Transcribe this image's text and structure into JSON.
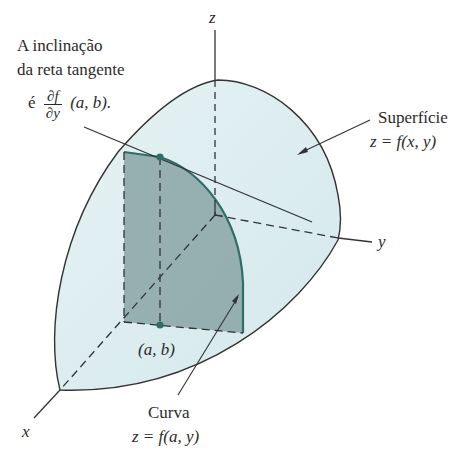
{
  "diagram": {
    "title_annotation": {
      "line1": "A inclinação",
      "line2": "da reta tangente",
      "prefix": "é",
      "frac_num": "∂f",
      "frac_den": "∂y",
      "suffix": "(a, b)."
    },
    "surface_label": {
      "line1": "Superfície",
      "line2": "z = f(x, y)"
    },
    "curve_label": {
      "line1": "Curva",
      "line2": "z = f(a, y)"
    },
    "point_label": "(a, b)",
    "axes": {
      "x": "x",
      "y": "y",
      "z": "z"
    },
    "colors": {
      "surface_fill": "#dcecef",
      "slice_fill": "#8fa9aa",
      "curve_stroke": "#2e6e66",
      "point_fill": "#2f6e66",
      "line": "#333333"
    }
  }
}
